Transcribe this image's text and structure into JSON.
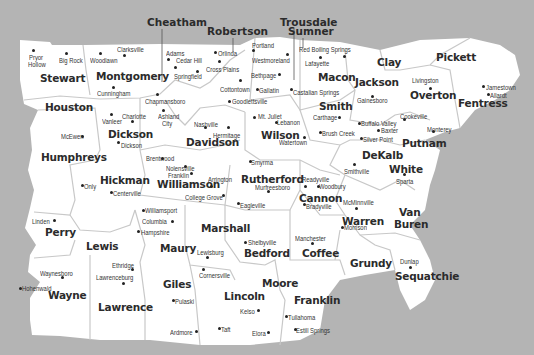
{
  "colors": {
    "background": "#b4b4b4",
    "land": "#ffffff",
    "border": "#c8c8c8",
    "text": "#2b2b2b",
    "leader_line": "#555555"
  },
  "external_labels": [
    {
      "name": "Cheatham",
      "x": 147,
      "y": 17,
      "line": [
        162,
        29,
        162,
        82
      ]
    },
    {
      "name": "Robertson",
      "x": 207,
      "y": 26,
      "line": [
        233,
        38,
        233,
        52
      ]
    },
    {
      "name": "Sumner",
      "x": 288,
      "y": 26,
      "line": [
        303,
        38,
        303,
        48
      ]
    },
    {
      "name": "Trousdale",
      "x": 280,
      "y": 17,
      "line": [
        294,
        29,
        294,
        80
      ]
    }
  ],
  "counties": [
    {
      "name": "Stewart",
      "x": 40,
      "y": 73
    },
    {
      "name": "Montgomery",
      "x": 96,
      "y": 71
    },
    {
      "name": "Houston",
      "x": 45,
      "y": 102
    },
    {
      "name": "Macon",
      "x": 318,
      "y": 72
    },
    {
      "name": "Clay",
      "x": 377,
      "y": 57
    },
    {
      "name": "Pickett",
      "x": 436,
      "y": 52
    },
    {
      "name": "Jackson",
      "x": 355,
      "y": 77
    },
    {
      "name": "Overton",
      "x": 410,
      "y": 90
    },
    {
      "name": "Fentress",
      "x": 458,
      "y": 98
    },
    {
      "name": "Smith",
      "x": 319,
      "y": 101
    },
    {
      "name": "Dickson",
      "x": 108,
      "y": 129
    },
    {
      "name": "Humphreys",
      "x": 41,
      "y": 152
    },
    {
      "name": "Davidson",
      "x": 186,
      "y": 137
    },
    {
      "name": "Wilson",
      "x": 261,
      "y": 130
    },
    {
      "name": "Putnam",
      "x": 402,
      "y": 138
    },
    {
      "name": "DeKalb",
      "x": 362,
      "y": 150
    },
    {
      "name": "White",
      "x": 389,
      "y": 164
    },
    {
      "name": "Hickman",
      "x": 100,
      "y": 175
    },
    {
      "name": "Williamson",
      "x": 157,
      "y": 179
    },
    {
      "name": "Rutherford",
      "x": 241,
      "y": 174
    },
    {
      "name": "Cannon",
      "x": 299,
      "y": 193
    },
    {
      "name": "Van",
      "x": 399,
      "y": 207
    },
    {
      "name": "Buren",
      "x": 394,
      "y": 219
    },
    {
      "name": "Warren",
      "x": 342,
      "y": 216
    },
    {
      "name": "Perry",
      "x": 45,
      "y": 227
    },
    {
      "name": "Lewis",
      "x": 86,
      "y": 241
    },
    {
      "name": "Maury",
      "x": 160,
      "y": 243
    },
    {
      "name": "Marshall",
      "x": 201,
      "y": 223
    },
    {
      "name": "Bedford",
      "x": 244,
      "y": 248
    },
    {
      "name": "Coffee",
      "x": 302,
      "y": 248
    },
    {
      "name": "Grundy",
      "x": 350,
      "y": 258
    },
    {
      "name": "Sequatchie",
      "x": 395,
      "y": 271
    },
    {
      "name": "Wayne",
      "x": 48,
      "y": 290
    },
    {
      "name": "Lawrence",
      "x": 98,
      "y": 302
    },
    {
      "name": "Giles",
      "x": 163,
      "y": 279
    },
    {
      "name": "Moore",
      "x": 262,
      "y": 278
    },
    {
      "name": "Lincoln",
      "x": 224,
      "y": 291
    },
    {
      "name": "Franklin",
      "x": 294,
      "y": 295
    }
  ],
  "towns": [
    {
      "name": "Pryor",
      "x": 29,
      "y": 54,
      "dot": [
        33,
        50
      ]
    },
    {
      "name": "Hollow",
      "x": 28,
      "y": 61
    },
    {
      "name": "Big Rock",
      "x": 59,
      "y": 57,
      "dot": [
        66,
        53
      ]
    },
    {
      "name": "Clarksville",
      "x": 117,
      "y": 46,
      "dot": [
        124,
        55
      ]
    },
    {
      "name": "Woodlawn",
      "x": 90,
      "y": 57,
      "dot": [
        100,
        53
      ]
    },
    {
      "name": "Cunningham",
      "x": 97,
      "y": 90,
      "dot": [
        113,
        87
      ]
    },
    {
      "name": "Adams",
      "x": 166,
      "y": 50,
      "dot": [
        168,
        59
      ]
    },
    {
      "name": "Cedar Hill",
      "x": 176,
      "y": 57,
      "dot": [
        175,
        67
      ]
    },
    {
      "name": "Springfield",
      "x": 174,
      "y": 73,
      "dot": [
        197,
        71
      ]
    },
    {
      "name": "Orlinda",
      "x": 218,
      "y": 50,
      "dot": [
        215,
        52
      ]
    },
    {
      "name": "Cross Plains",
      "x": 206,
      "y": 66,
      "dot": [
        219,
        61
      ]
    },
    {
      "name": "Portland",
      "x": 252,
      "y": 42,
      "dot": [
        253,
        50
      ]
    },
    {
      "name": "Westmoreland",
      "x": 252,
      "y": 57,
      "dot": [
        287,
        54
      ]
    },
    {
      "name": "Bethpage",
      "x": 251,
      "y": 72,
      "dot": [
        279,
        74
      ]
    },
    {
      "name": "Gallatin",
      "x": 259,
      "y": 87,
      "dot": [
        257,
        89
      ]
    },
    {
      "name": "Cottontown",
      "x": 220,
      "y": 86,
      "dot": [
        240,
        80
      ]
    },
    {
      "name": "Goodlettsville",
      "x": 232,
      "y": 98,
      "dot": [
        229,
        101
      ]
    },
    {
      "name": "Red Boiling Springs",
      "x": 299,
      "y": 46,
      "dot": [
        344,
        56
      ]
    },
    {
      "name": "Lafayette",
      "x": 305,
      "y": 60,
      "dot": [
        320,
        57
      ]
    },
    {
      "name": "Castalian Springs",
      "x": 293,
      "y": 89,
      "dot": [
        291,
        89
      ]
    },
    {
      "name": "Chapmansboro",
      "x": 145,
      "y": 98,
      "dot": [
        157,
        94
      ]
    },
    {
      "name": "Ashland",
      "x": 158,
      "y": 113,
      "dot": [
        163,
        110
      ]
    },
    {
      "name": "City",
      "x": 162,
      "y": 120
    },
    {
      "name": "Charlotte",
      "x": 122,
      "y": 113,
      "dot": [
        132,
        121
      ]
    },
    {
      "name": "Vanleer",
      "x": 102,
      "y": 118,
      "dot": [
        111,
        114
      ]
    },
    {
      "name": "Dickson",
      "x": 121,
      "y": 142,
      "dot": [
        118,
        142
      ]
    },
    {
      "name": "McEwen",
      "x": 61,
      "y": 133,
      "dot": [
        82,
        136
      ]
    },
    {
      "name": "Nashville",
      "x": 194,
      "y": 121,
      "dot": [
        205,
        127
      ]
    },
    {
      "name": "Hermitage",
      "x": 213,
      "y": 132,
      "dot": [
        228,
        127
      ]
    },
    {
      "name": "Mt. Juliet",
      "x": 258,
      "y": 113,
      "dot": [
        254,
        117
      ]
    },
    {
      "name": "Lebanon",
      "x": 277,
      "y": 119,
      "dot": [
        276,
        122
      ]
    },
    {
      "name": "Watertown",
      "x": 279,
      "y": 139,
      "dot": [
        304,
        137
      ]
    },
    {
      "name": "Carthage",
      "x": 313,
      "y": 114,
      "dot": [
        339,
        117
      ]
    },
    {
      "name": "Brush Creek",
      "x": 322,
      "y": 130,
      "dot": [
        320,
        132
      ]
    },
    {
      "name": "Gainesboro",
      "x": 357,
      "y": 97,
      "dot": [
        372,
        96
      ]
    },
    {
      "name": "Livingston",
      "x": 412,
      "y": 77,
      "dot": [
        430,
        88
      ]
    },
    {
      "name": "Jamestown",
      "x": 486,
      "y": 84,
      "dot": [
        483,
        86
      ]
    },
    {
      "name": "Allardt",
      "x": 490,
      "y": 92,
      "dot": [
        488,
        94
      ]
    },
    {
      "name": "Cookeville",
      "x": 400,
      "y": 113,
      "dot": [
        404,
        119
      ]
    },
    {
      "name": "Monterey",
      "x": 427,
      "y": 126,
      "dot": [
        433,
        131
      ]
    },
    {
      "name": "Buffalo Valley",
      "x": 361,
      "y": 120,
      "dot": [
        359,
        123
      ]
    },
    {
      "name": "Baxter",
      "x": 381,
      "y": 127,
      "dot": [
        378,
        130
      ]
    },
    {
      "name": "Silver Point",
      "x": 363,
      "y": 136,
      "dot": [
        361,
        138
      ]
    },
    {
      "name": "Smithville",
      "x": 344,
      "y": 168,
      "dot": [
        354,
        164
      ]
    },
    {
      "name": "Sparta",
      "x": 396,
      "y": 178,
      "dot": [
        404,
        174
      ]
    },
    {
      "name": "Brentwood",
      "x": 146,
      "y": 155,
      "dot": [
        162,
        158
      ]
    },
    {
      "name": "Nolensville",
      "x": 166,
      "y": 165,
      "dot": [
        185,
        166
      ]
    },
    {
      "name": "Franklin",
      "x": 168,
      "y": 172,
      "dot": [
        191,
        173
      ]
    },
    {
      "name": "Arrington",
      "x": 208,
      "y": 176,
      "dot": [
        211,
        186
      ]
    },
    {
      "name": "College Grove",
      "x": 185,
      "y": 194,
      "dot": [
        223,
        195
      ]
    },
    {
      "name": "Smyrma",
      "x": 251,
      "y": 159,
      "dot": [
        250,
        161
      ]
    },
    {
      "name": "Murfreesboro",
      "x": 255,
      "y": 184,
      "dot": [
        268,
        191
      ]
    },
    {
      "name": "Eagleville",
      "x": 240,
      "y": 202,
      "dot": [
        238,
        203
      ]
    },
    {
      "name": "Readyville",
      "x": 302,
      "y": 176,
      "dot": [
        305,
        186
      ]
    },
    {
      "name": "Woodbury",
      "x": 319,
      "y": 183,
      "dot": [
        318,
        186
      ]
    },
    {
      "name": "Bradyville",
      "x": 306,
      "y": 203,
      "dot": [
        304,
        204
      ]
    },
    {
      "name": "McMinnville",
      "x": 343,
      "y": 199,
      "dot": [
        356,
        208
      ]
    },
    {
      "name": "Morrison",
      "x": 344,
      "y": 224,
      "dot": [
        342,
        227
      ]
    },
    {
      "name": "Only",
      "x": 84,
      "y": 183,
      "dot": [
        82,
        185
      ]
    },
    {
      "name": "Centerville",
      "x": 113,
      "y": 190,
      "dot": [
        111,
        192
      ]
    },
    {
      "name": "Williamsport",
      "x": 145,
      "y": 207,
      "dot": [
        143,
        210
      ]
    },
    {
      "name": "Columbia",
      "x": 142,
      "y": 218,
      "dot": [
        172,
        221
      ]
    },
    {
      "name": "Hampshire",
      "x": 141,
      "y": 229,
      "dot": [
        138,
        231
      ]
    },
    {
      "name": "Linden",
      "x": 32,
      "y": 218,
      "dot": [
        54,
        220
      ]
    },
    {
      "name": "Hohenwald",
      "x": 22,
      "y": 285,
      "dot": [
        20,
        288
      ]
    },
    {
      "name": "Waynesboro",
      "x": 40,
      "y": 270,
      "dot": [
        62,
        277
      ]
    },
    {
      "name": "Ethridge",
      "x": 112,
      "y": 262,
      "dot": [
        132,
        269
      ]
    },
    {
      "name": "Lawrenceburg",
      "x": 96,
      "y": 274,
      "dot": [
        123,
        283
      ]
    },
    {
      "name": "Lewisburg",
      "x": 197,
      "y": 249,
      "dot": [
        207,
        257
      ]
    },
    {
      "name": "Cornersville",
      "x": 199,
      "y": 272,
      "dot": [
        203,
        269
      ]
    },
    {
      "name": "Shelbyville",
      "x": 248,
      "y": 239,
      "dot": [
        245,
        242
      ]
    },
    {
      "name": "Manchester",
      "x": 295,
      "y": 235,
      "dot": [
        312,
        243
      ]
    },
    {
      "name": "Dunlap",
      "x": 400,
      "y": 258,
      "dot": [
        410,
        267
      ]
    },
    {
      "name": "Pulaski",
      "x": 175,
      "y": 298,
      "dot": [
        173,
        300
      ]
    },
    {
      "name": "Ardmore",
      "x": 170,
      "y": 329,
      "dot": [
        196,
        331
      ]
    },
    {
      "name": "Taft",
      "x": 221,
      "y": 326,
      "dot": [
        219,
        328
      ]
    },
    {
      "name": "Elora",
      "x": 252,
      "y": 330,
      "dot": [
        268,
        332
      ]
    },
    {
      "name": "Kelso",
      "x": 240,
      "y": 308,
      "dot": [
        258,
        310
      ]
    },
    {
      "name": "Tullahoma",
      "x": 288,
      "y": 314,
      "dot": [
        286,
        316
      ]
    },
    {
      "name": "Estill Springs",
      "x": 296,
      "y": 327,
      "dot": [
        295,
        329
      ]
    }
  ]
}
